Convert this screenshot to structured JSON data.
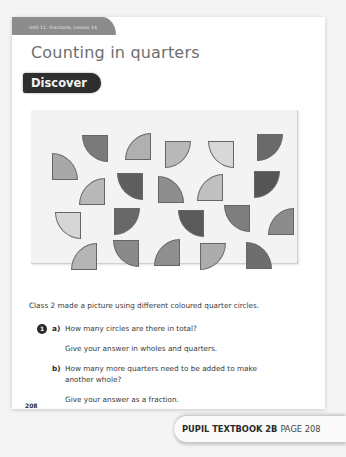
{
  "header": {
    "unit_label": "Unit 11: Fractions, Lesson 14",
    "title": "Counting in quarters",
    "section_badge": "Discover"
  },
  "picture": {
    "description": "Picture made of 21 coloured quarter circles",
    "shapes": [
      {
        "x": 51,
        "y": 25,
        "corner": "tr",
        "color": "#7a7a7a"
      },
      {
        "x": 94,
        "y": 23,
        "corner": "br",
        "color": "#b0b0b0"
      },
      {
        "x": 134,
        "y": 31,
        "corner": "tl",
        "color": "#b8b8b8"
      },
      {
        "x": 177,
        "y": 31,
        "corner": "tr",
        "color": "#d8d8d8"
      },
      {
        "x": 226,
        "y": 24,
        "corner": "tl",
        "color": "#6a6a6a"
      },
      {
        "x": 21,
        "y": 43,
        "corner": "bl",
        "color": "#a8a8a8"
      },
      {
        "x": 48,
        "y": 68,
        "corner": "br",
        "color": "#b8b8b8"
      },
      {
        "x": 86,
        "y": 63,
        "corner": "tr",
        "color": "#5e5e5e"
      },
      {
        "x": 127,
        "y": 66,
        "corner": "bl",
        "color": "#8e8e8e"
      },
      {
        "x": 166,
        "y": 64,
        "corner": "br",
        "color": "#c0c0c0"
      },
      {
        "x": 223,
        "y": 61,
        "corner": "tl",
        "color": "#555555"
      },
      {
        "x": 24,
        "y": 102,
        "corner": "tr",
        "color": "#d6d6d6"
      },
      {
        "x": 83,
        "y": 98,
        "corner": "tl",
        "color": "#686868"
      },
      {
        "x": 147,
        "y": 100,
        "corner": "tr",
        "color": "#5a5a5a"
      },
      {
        "x": 193,
        "y": 95,
        "corner": "tr",
        "color": "#7e7e7e"
      },
      {
        "x": 237,
        "y": 98,
        "corner": "br",
        "color": "#8c8c8c"
      },
      {
        "x": 40,
        "y": 133,
        "corner": "br",
        "color": "#b5b5b5"
      },
      {
        "x": 82,
        "y": 130,
        "corner": "tr",
        "color": "#8a8a8a"
      },
      {
        "x": 123,
        "y": 129,
        "corner": "br",
        "color": "#8f8f8f"
      },
      {
        "x": 169,
        "y": 133,
        "corner": "tl",
        "color": "#acacac"
      },
      {
        "x": 215,
        "y": 132,
        "corner": "bl",
        "color": "#6e6e6e"
      }
    ]
  },
  "intro_text": "Class 2 made a picture using different coloured quarter circles.",
  "question": {
    "number": "1",
    "parts": [
      {
        "label": "a)",
        "lines": [
          "How many circles are there in total?",
          "Give your answer in wholes and quarters."
        ]
      },
      {
        "label": "b)",
        "lines": [
          "How many more quarters need to be added to make",
          "another whole?",
          "Give your answer as a fraction."
        ]
      }
    ]
  },
  "footer": {
    "page_number": "208",
    "reference_book": "PUPIL TEXTBOOK 2B",
    "reference_page": "PAGE 208"
  }
}
